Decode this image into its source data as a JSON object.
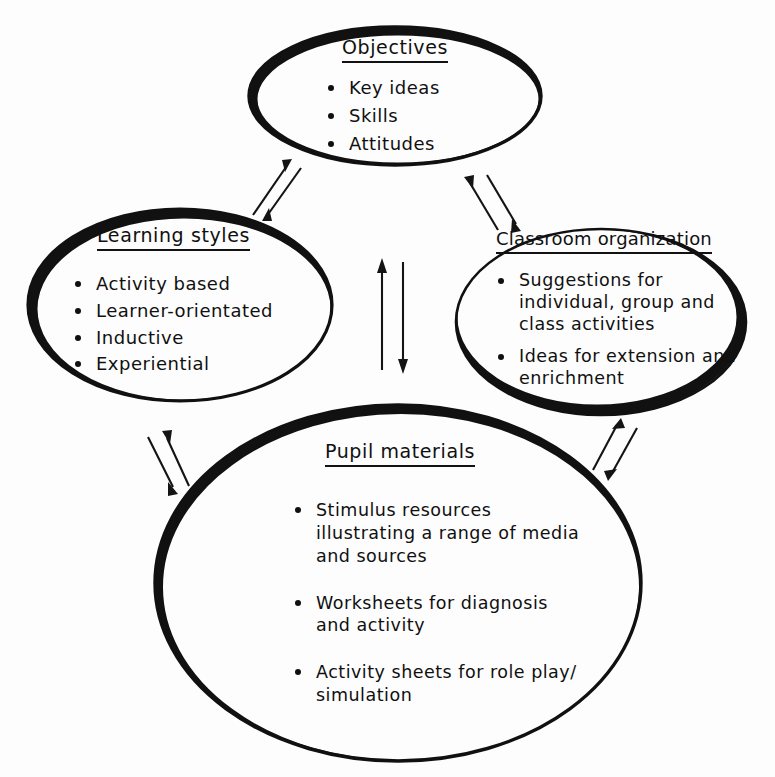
{
  "diagram": {
    "background_color": "#fdfdfd",
    "ink_color": "#101010",
    "nodes": [
      {
        "id": "objectives",
        "title": "Objectives",
        "bullets": [
          "Key ideas",
          "Skills",
          "Attitudes"
        ]
      },
      {
        "id": "learning_styles",
        "title": "Learning styles",
        "bullets": [
          "Activity based",
          "Learner-orientated",
          "Inductive",
          "Experiential"
        ]
      },
      {
        "id": "classroom_organization",
        "title": "Classroom organization",
        "bullets": [
          "Suggestions for individual, group and class activities",
          "Ideas for extension and enrichment"
        ]
      },
      {
        "id": "pupil_materials",
        "title": "Pupil materials",
        "bullets": [
          "Stimulus resources illustrating a range of media and sources",
          "Worksheets for diagnosis and activity",
          "Activity sheets for role play/ simulation"
        ]
      }
    ],
    "connectors": [
      {
        "id": "learning-objectives",
        "from": "learning_styles",
        "to": "objectives",
        "style": "double-arrow"
      },
      {
        "id": "classroom-objectives",
        "from": "classroom_organization",
        "to": "objectives",
        "style": "double-arrow"
      },
      {
        "id": "learning-pupil",
        "from": "learning_styles",
        "to": "pupil_materials",
        "style": "double-arrow"
      },
      {
        "id": "classroom-pupil",
        "from": "classroom_organization",
        "to": "pupil_materials",
        "style": "double-arrow"
      },
      {
        "id": "objectives-pupil",
        "from": "objectives",
        "to": "pupil_materials",
        "style": "double-arrow"
      }
    ]
  }
}
